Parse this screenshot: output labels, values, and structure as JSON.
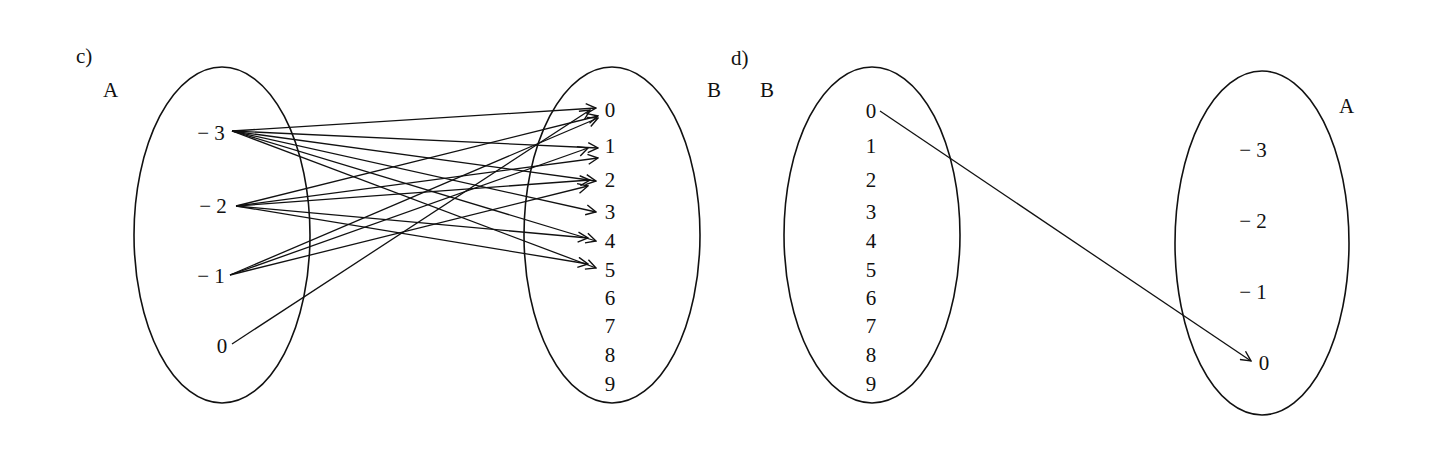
{
  "panel_c": {
    "label": "c)",
    "domain_set": {
      "name": "A",
      "elements": [
        "− 3",
        "− 2",
        "− 1",
        "0"
      ]
    },
    "codomain_set": {
      "name": "B",
      "elements": [
        "0",
        "1",
        "2",
        "3",
        "4",
        "5",
        "6",
        "7",
        "8",
        "9"
      ]
    },
    "edges": [
      {
        "from": "-3",
        "to": "0"
      },
      {
        "from": "-3",
        "to": "1"
      },
      {
        "from": "-3",
        "to": "2"
      },
      {
        "from": "-3",
        "to": "3"
      },
      {
        "from": "-3",
        "to": "4"
      },
      {
        "from": "-3",
        "to": "5"
      },
      {
        "from": "-2",
        "to": "0"
      },
      {
        "from": "-2",
        "to": "1"
      },
      {
        "from": "-2",
        "to": "2"
      },
      {
        "from": "-2",
        "to": "4"
      },
      {
        "from": "-2",
        "to": "5"
      },
      {
        "from": "-1",
        "to": "0"
      },
      {
        "from": "-1",
        "to": "1"
      },
      {
        "from": "-1",
        "to": "2"
      },
      {
        "from": "0",
        "to": "0"
      }
    ]
  },
  "panel_d": {
    "label": "d)",
    "domain_set": {
      "name": "B",
      "elements": [
        "0",
        "1",
        "2",
        "3",
        "4",
        "5",
        "6",
        "7",
        "8",
        "9"
      ]
    },
    "codomain_set": {
      "name": "A",
      "elements": [
        "− 3",
        "− 2",
        "− 1",
        "0"
      ]
    },
    "edges": [
      {
        "from": "0",
        "to": "0"
      }
    ]
  }
}
